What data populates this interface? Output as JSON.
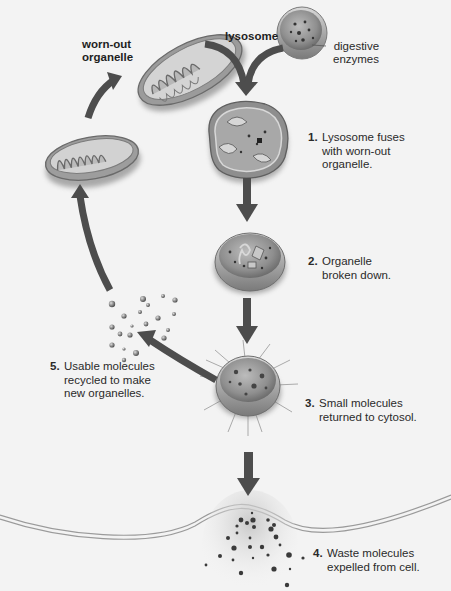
{
  "labels": {
    "worn_out_organelle": "worn-out\norganelle",
    "lysosome": "lysosome",
    "digestive_enzymes": "digestive\nenzymes"
  },
  "steps": [
    {
      "number": "1.",
      "text": "Lysosome fuses\nwith worn-out\norganelle."
    },
    {
      "number": "2.",
      "text": "Organelle\nbroken down."
    },
    {
      "number": "3.",
      "text": "Small molecules\nreturned to cytosol."
    },
    {
      "number": "4.",
      "text": "Waste molecules\nexpelled from cell."
    },
    {
      "number": "5.",
      "text": "Usable molecules\nrecycled to make\nnew organelles."
    }
  ],
  "icons": {
    "worn_out_mitochondrion": "mitochondrion-icon",
    "new_mitochondrion": "mitochondrion-icon",
    "lysosome": "lysosome-icon",
    "fused_organelle": "fused-organelle-icon",
    "digesting_vesicle": "digesting-vesicle-icon",
    "releasing_vesicle": "releasing-vesicle-icon",
    "cell_membrane": "cell-membrane-icon",
    "molecules": "molecule-cluster-icon"
  },
  "colors": {
    "background": "#f3f3f3",
    "arrow": "#4a4a4a",
    "membrane": "#8a8a8a",
    "organelle_fill": "#a9a9a9",
    "text": "#2a2a2a"
  }
}
